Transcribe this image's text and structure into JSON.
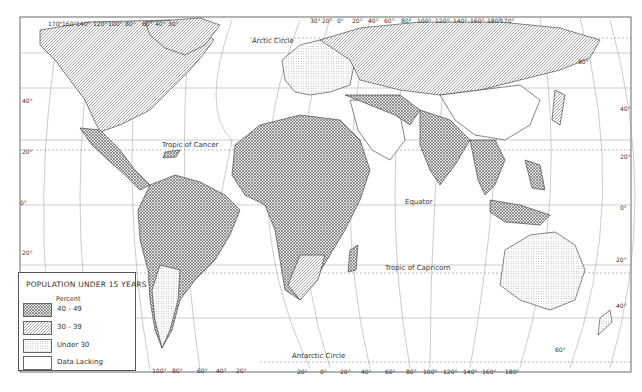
{
  "map": {
    "title": "POPULATION UNDER 15 YEARS",
    "legend": {
      "subtitle": "Percent",
      "items": [
        {
          "label": "40  -  49",
          "pattern": "crosshatch"
        },
        {
          "label": "30  -   39",
          "pattern": "diagonal"
        },
        {
          "label": "Under  30",
          "pattern": "dotted"
        },
        {
          "label": "Data Lacking",
          "pattern": "blank"
        }
      ]
    },
    "annotations": {
      "arctic_circle": "Arctic Circle",
      "tropic_cancer": "Tropic of Cancer",
      "equator": "Equator",
      "tropic_capricorn": "Tropic of Capricorn",
      "antarctic_circle": "Antarctic Circle"
    },
    "top_longitudes_left": [
      "170°",
      "160°",
      "140°",
      "120°",
      "100°",
      "80°",
      "60°",
      "40°",
      "30°"
    ],
    "top_longitudes_right": [
      "30°",
      "20°",
      "0°",
      "20°",
      "40°",
      "60°",
      "80°",
      "100°",
      "120°",
      "140°",
      "160°",
      "180°",
      "170°"
    ],
    "bottom_longitudes_left": [
      "100°",
      "80°",
      "60°",
      "40°",
      "20°"
    ],
    "bottom_longitudes_right": [
      "20°",
      "0°",
      "20°",
      "40°",
      "60°",
      "80°",
      "100°",
      "120°",
      "140°",
      "160°",
      "180°"
    ],
    "latitudes_left": [
      "80°",
      "40°",
      "20°",
      "0°",
      "20°"
    ],
    "latitudes_right": [
      "80°",
      "40°",
      "20°",
      "0°",
      "20°",
      "40°",
      "60°"
    ],
    "colors": {
      "ink": "#333333",
      "grid": "#888888",
      "paper": "#ffffff"
    }
  }
}
